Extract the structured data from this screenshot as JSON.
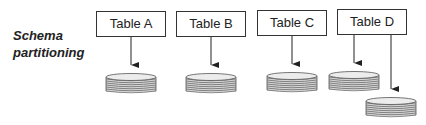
{
  "diagram": {
    "label_line1": "Schema",
    "label_line2": "partitioning",
    "tables": [
      {
        "name": "Table A"
      },
      {
        "name": "Table B"
      },
      {
        "name": "Table C"
      },
      {
        "name": "Table D"
      }
    ],
    "colors": {
      "stroke": "#333333",
      "disk_fill": "#e0e0e0",
      "disk_stripe": "#777777"
    }
  }
}
